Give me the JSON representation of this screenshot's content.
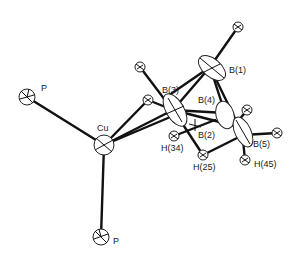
{
  "diagram": {
    "type": "ORTEP molecular structure",
    "atoms": [
      {
        "id": "P1",
        "label": "P",
        "x": 27,
        "y": 97
      },
      {
        "id": "Cu",
        "label": "Cu",
        "x": 104,
        "y": 145
      },
      {
        "id": "P2",
        "label": "P",
        "x": 101,
        "y": 237
      },
      {
        "id": "B1",
        "label": "B(1)",
        "x": 210,
        "y": 67
      },
      {
        "id": "B2",
        "label": "B(2)",
        "x": 195,
        "y": 125
      },
      {
        "id": "B3",
        "label": "B(3)",
        "x": 173,
        "y": 110
      },
      {
        "id": "B4",
        "label": "B(4)",
        "x": 225,
        "y": 113
      },
      {
        "id": "B5",
        "label": "B(5)",
        "x": 243,
        "y": 135
      },
      {
        "id": "H34",
        "label": "H(34)",
        "x": 174,
        "y": 136
      },
      {
        "id": "H25",
        "label": "H(25)",
        "x": 203,
        "y": 155
      },
      {
        "id": "H45",
        "label": "H(45)",
        "x": 245,
        "y": 160
      }
    ],
    "labels": {
      "p_left": "P",
      "cu": "Cu",
      "p_bottom": "P",
      "b1": "B(1)",
      "b2": "B(2)",
      "b3": "B(3)",
      "b4": "B(4)",
      "b5": "B(5)",
      "h34": "H(34)",
      "h25": "H(25)",
      "h45": "H(45)"
    }
  }
}
